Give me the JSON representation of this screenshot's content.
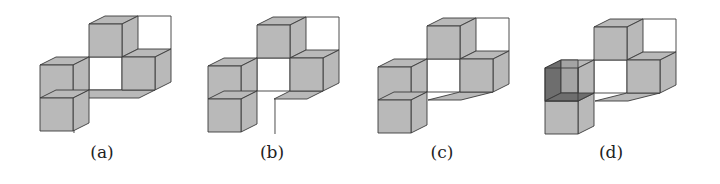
{
  "figure": {
    "colors": {
      "face": "#b9b9b9",
      "face_dark": "#6e6e6e",
      "face_mid": "#a4a4a4",
      "stroke": "#3a3a3a",
      "empty": "#ffffff"
    },
    "geometry": {
      "unit": 33,
      "dx": 16,
      "dy": -8
    },
    "panels": [
      {
        "id": "a",
        "label": "(a)",
        "label_x": 102,
        "origin_x": 40,
        "origin_y": 32,
        "cubes": [
          [
            1,
            0,
            1
          ],
          [
            0,
            1,
            0
          ],
          [
            0,
            2,
            0
          ],
          [
            2,
            1,
            1
          ]
        ],
        "floor": {
          "from_col": 1,
          "to_col": 2
        },
        "stem": {
          "col": 1.03,
          "length": 35
        },
        "open_cube": null
      },
      {
        "id": "b",
        "label": "(b)",
        "label_x": 272,
        "origin_x": 208,
        "origin_y": 33,
        "cubes": [
          [
            1,
            0,
            1
          ],
          [
            0,
            1,
            0
          ],
          [
            0,
            2,
            0
          ],
          [
            2,
            1,
            1
          ]
        ],
        "floor": {
          "from_col": 2,
          "to_col": 2
        },
        "stem": {
          "col": 2.03,
          "length": 35
        },
        "open_cube": null
      },
      {
        "id": "c",
        "label": "(c)",
        "label_x": 442,
        "origin_x": 378,
        "origin_y": 34,
        "cubes": [
          [
            1,
            0,
            1
          ],
          [
            0,
            1,
            0
          ],
          [
            0,
            2,
            0
          ],
          [
            2,
            1,
            1
          ]
        ],
        "floor": {
          "from_col": 2,
          "to_col": 2,
          "shift": -0.5
        },
        "stem": null,
        "open_cube": null
      },
      {
        "id": "d",
        "label": "(d)",
        "label_x": 611,
        "origin_x": 545,
        "origin_y": 35,
        "cubes": [
          [
            1,
            0,
            1
          ],
          [
            0,
            2,
            0
          ],
          [
            2,
            1,
            1
          ]
        ],
        "floor": {
          "from_col": 2,
          "to_col": 2,
          "shift": -0.5
        },
        "stem": null,
        "open_cube": [
          0,
          1,
          0
        ]
      }
    ]
  }
}
